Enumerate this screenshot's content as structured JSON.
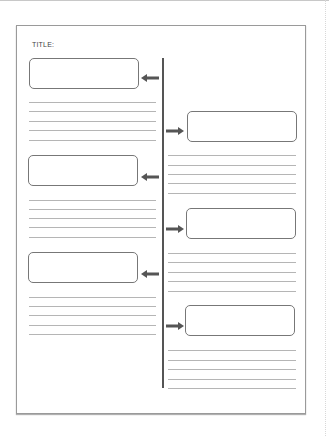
{
  "worksheet": {
    "title_label": "TITLE:",
    "left_events": [
      {
        "box": {
          "x": 29,
          "y": 58
        },
        "arrow_y": 72,
        "lines_y": [
          102,
          111,
          121,
          130,
          140
        ]
      },
      {
        "box": {
          "x": 28,
          "y": 155
        },
        "arrow_y": 171,
        "lines_y": [
          200,
          209,
          218,
          227,
          237
        ]
      },
      {
        "box": {
          "x": 28,
          "y": 252
        },
        "arrow_y": 268,
        "lines_y": [
          297,
          306,
          315,
          325,
          334
        ]
      }
    ],
    "right_events": [
      {
        "box": {
          "x": 187,
          "y": 111
        },
        "arrow_y": 125,
        "lines_y": [
          155,
          165,
          174,
          183,
          193
        ]
      },
      {
        "box": {
          "x": 186,
          "y": 208
        },
        "arrow_y": 223,
        "lines_y": [
          253,
          262,
          272,
          281,
          291
        ]
      },
      {
        "box": {
          "x": 185,
          "y": 305
        },
        "arrow_y": 320,
        "lines_y": [
          350,
          360,
          369,
          379,
          388
        ]
      }
    ],
    "colors": {
      "arrow": "#555555",
      "border": "#777777",
      "rule": "#b5b5b5"
    }
  }
}
